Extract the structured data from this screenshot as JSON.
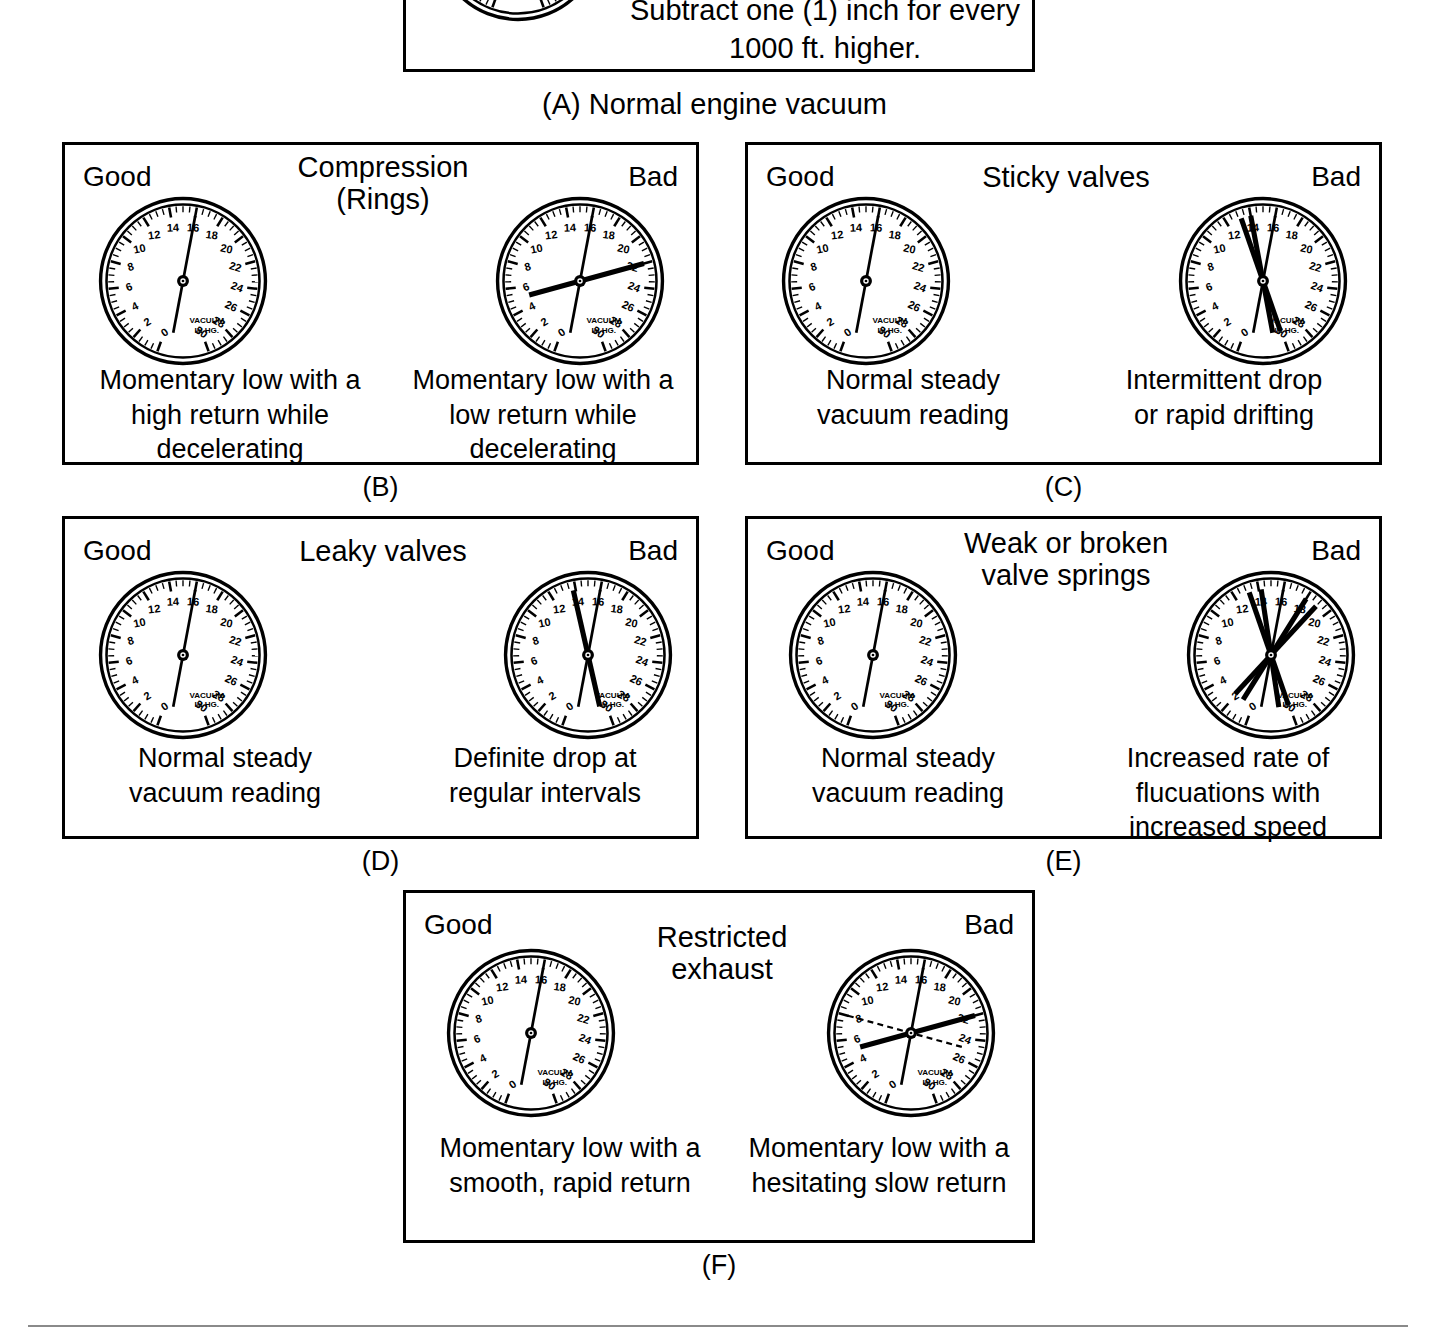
{
  "figure": {
    "title_a": "(A) Normal engine vacuum",
    "top_note_lines": [
      "Subtract one (1) inch for every",
      "1000 ft. higher."
    ],
    "gauge_face": {
      "unit_line1": "VACUUM",
      "unit_line2": "IN HG.",
      "tick_labels": [
        "0",
        "2",
        "4",
        "6",
        "8",
        "10",
        "12",
        "14",
        "16",
        "18",
        "20",
        "22",
        "24",
        "26",
        "28",
        "30"
      ],
      "min": 0,
      "max": 30
    },
    "good_label": "Good",
    "bad_label": "Bad"
  },
  "panels": [
    {
      "letter": "(B)",
      "header": [
        "Compression",
        "(Rings)"
      ],
      "good": {
        "caption": [
          "Momentary low with a",
          "high return while",
          "decelerating"
        ],
        "needles": [
          {
            "value": 16,
            "style": "solid",
            "weight": "normal"
          }
        ]
      },
      "bad": {
        "caption": [
          "Momentary low with a",
          "low return while",
          "decelerating"
        ],
        "needles": [
          {
            "value": 16,
            "style": "solid",
            "weight": "normal"
          },
          {
            "value": 22,
            "style": "solid",
            "weight": "heavy"
          }
        ]
      }
    },
    {
      "letter": "(C)",
      "header": [
        "Sticky valves"
      ],
      "good": {
        "caption": [
          "Normal steady",
          "vacuum reading"
        ],
        "needles": [
          {
            "value": 16,
            "style": "solid",
            "weight": "normal"
          }
        ]
      },
      "bad": {
        "caption": [
          "Intermittent drop",
          "or rapid drifting"
        ],
        "needles": [
          {
            "value": 16,
            "style": "solid",
            "weight": "normal"
          },
          {
            "value": 14,
            "style": "solid",
            "weight": "heavy"
          },
          {
            "value": 13.2,
            "style": "solid",
            "weight": "heavy"
          }
        ]
      }
    },
    {
      "letter": "(D)",
      "header": [
        "Leaky valves"
      ],
      "good": {
        "caption": [
          "Normal steady",
          "vacuum reading"
        ],
        "needles": [
          {
            "value": 16,
            "style": "solid",
            "weight": "normal"
          }
        ]
      },
      "bad": {
        "caption": [
          "Definite drop at",
          "regular intervals"
        ],
        "needles": [
          {
            "value": 16,
            "style": "solid",
            "weight": "normal"
          },
          {
            "value": 13.8,
            "style": "solid",
            "weight": "heavy"
          }
        ]
      }
    },
    {
      "letter": "(E)",
      "header": [
        "Weak or broken",
        "valve springs"
      ],
      "good": {
        "caption": [
          "Normal steady",
          "vacuum reading"
        ],
        "needles": [
          {
            "value": 16,
            "style": "solid",
            "weight": "normal"
          }
        ]
      },
      "bad": {
        "caption": [
          "Increased rate of",
          "flucuations with",
          "increased speed"
        ],
        "needles": [
          {
            "value": 16,
            "style": "solid",
            "weight": "normal"
          },
          {
            "value": 13.2,
            "style": "solid",
            "weight": "heavy"
          },
          {
            "value": 14.2,
            "style": "solid",
            "weight": "heavy"
          },
          {
            "value": 18.0,
            "style": "solid",
            "weight": "heavy"
          },
          {
            "value": 19.0,
            "style": "solid",
            "weight": "heavy"
          }
        ]
      }
    },
    {
      "letter": "(F)",
      "header": [
        "Restricted",
        "exhaust"
      ],
      "good": {
        "caption": [
          "Momentary low with a",
          "smooth, rapid return"
        ],
        "needles": [
          {
            "value": 16,
            "style": "solid",
            "weight": "normal"
          }
        ]
      },
      "bad": {
        "caption": [
          "Momentary low with a",
          "hesitating slow return"
        ],
        "needles": [
          {
            "value": 16,
            "style": "solid",
            "weight": "normal"
          },
          {
            "value": 22,
            "style": "solid",
            "weight": "heavy"
          },
          {
            "value": 8,
            "style": "dashed",
            "weight": "normal"
          }
        ]
      }
    }
  ]
}
